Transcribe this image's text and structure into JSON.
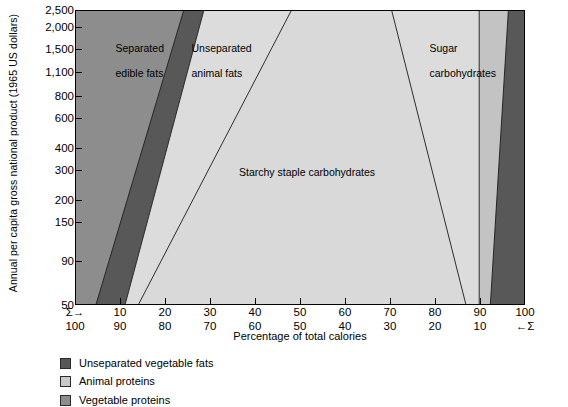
{
  "chart_data": {
    "type": "area",
    "title": "",
    "xlabel": "Percentage of total calories",
    "ylabel": "Annual per capita gross national product (1965 US dollars)",
    "yscale": "log",
    "ylim": [
      50,
      2500
    ],
    "yticks": [
      50,
      90,
      150,
      200,
      300,
      400,
      600,
      800,
      1100,
      1500,
      2000,
      2500
    ],
    "ytick_labels": [
      "50",
      "90",
      "150",
      "200",
      "300",
      "400",
      "600",
      "800",
      "1,100",
      "1,500",
      "2,000",
      "2,500"
    ],
    "xlim": [
      0,
      100
    ],
    "xticks": [
      0,
      10,
      20,
      30,
      40,
      50,
      60,
      70,
      80,
      90,
      100
    ],
    "xtick_labels_top": [
      "Σ→",
      "10",
      "20",
      "30",
      "40",
      "50",
      "60",
      "70",
      "80",
      "90",
      "100"
    ],
    "xtick_labels_bottom": [
      "100",
      "90",
      "80",
      "70",
      "60",
      "50",
      "40",
      "30",
      "20",
      "10",
      "←Σ"
    ],
    "grid": false,
    "legend_position": "below-left",
    "bands": [
      {
        "name": "vegetable-proteins",
        "label": "Vegetable proteins",
        "color": "#8d8d8d",
        "x_at_ymin": 0.0,
        "x_at_ymax": 0.0,
        "x_upper_at_ymin": 4.5,
        "x_upper_at_ymax": 24.0
      },
      {
        "name": "separated-edible-fats",
        "label": "Separated edible fats",
        "color": "#585858",
        "x_lower_at_ymin": 4.5,
        "x_lower_at_ymax": 24.0,
        "x_upper_at_ymin": 11.0,
        "x_upper_at_ymax": 28.5
      },
      {
        "name": "unseparated-animal-fats",
        "label": "Unseparated animal fats",
        "color": "#dcdcdc",
        "x_lower_at_ymin": 11.0,
        "x_lower_at_ymax": 28.5,
        "x_upper_at_ymin": 14.0,
        "x_upper_at_ymax": 48.0
      },
      {
        "name": "starchy-staple-carbohydrates",
        "label": "Starchy staple carbohydrates",
        "color": "#d9d9d9",
        "x_lower_at_ymin": 14.0,
        "x_lower_at_ymax": 48.0,
        "x_upper_at_ymin": 87.0,
        "x_upper_at_ymax": 70.5
      },
      {
        "name": "sugar-carbohydrates",
        "label": "Sugar carbohydrates",
        "color": "#dcdcdc",
        "x_lower_at_ymin": 87.0,
        "x_lower_at_ymax": 70.5,
        "x_upper_at_ymin": 90.0,
        "x_upper_at_ymax": 90.0
      },
      {
        "name": "animal-proteins",
        "label": "Animal proteins",
        "color": "#c3c3c3",
        "x_lower_at_ymin": 90.0,
        "x_lower_at_ymax": 90.0,
        "x_upper_at_ymin": 92.5,
        "x_upper_at_ymax": 96.5
      },
      {
        "name": "unseparated-vegetable-fats",
        "label": "Unseparated vegetable fats",
        "color": "#585858",
        "x_lower_at_ymin": 92.5,
        "x_lower_at_ymax": 96.5,
        "x_upper_at_ymin": 100.0,
        "x_upper_at_ymax": 100.0
      }
    ],
    "annotations": [
      {
        "name": "separated-edible-fats",
        "text": "Separated\nedible fats",
        "x": 12,
        "y": 2050
      },
      {
        "name": "unseparated-animal-fats",
        "text": "Unseparated\nanimal fats",
        "x": 30,
        "y": 2050
      },
      {
        "name": "starchy-staple-carbohydrates",
        "text": "Starchy staple carbohydrates",
        "x": 50,
        "y": 330
      },
      {
        "name": "sugar-carbohydrates",
        "text": "Sugar\ncarbohydrates",
        "x": 79,
        "y": 2050
      }
    ]
  },
  "axis": {
    "y_title": "Annual per capita gross national product (1965 US dollars)",
    "x_title": "Percentage of total calories",
    "y_labels": [
      "2,500",
      "2,000",
      "1,500",
      "1,100",
      "800",
      "600",
      "400",
      "300",
      "200",
      "150",
      "90",
      "50"
    ],
    "x_labels": [
      {
        "top": "Σ→",
        "bottom": "100"
      },
      {
        "top": "10",
        "bottom": "90"
      },
      {
        "top": "20",
        "bottom": "80"
      },
      {
        "top": "30",
        "bottom": "70"
      },
      {
        "top": "40",
        "bottom": "60"
      },
      {
        "top": "50",
        "bottom": "50"
      },
      {
        "top": "60",
        "bottom": "40"
      },
      {
        "top": "70",
        "bottom": "30"
      },
      {
        "top": "80",
        "bottom": "20"
      },
      {
        "top": "90",
        "bottom": "10"
      },
      {
        "top": "100",
        "bottom": "←Σ"
      }
    ]
  },
  "plot_labels": {
    "separated_edible_fats_l1": "Separated",
    "separated_edible_fats_l2": "edible fats",
    "unseparated_animal_fats_l1": "Unseparated",
    "unseparated_animal_fats_l2": "animal fats",
    "sugar_carbohydrates_l1": "Sugar",
    "sugar_carbohydrates_l2": "carbohydrates",
    "starchy_staple": "Starchy staple carbohydrates"
  },
  "legend": {
    "items": [
      {
        "label": "Unseparated vegetable fats",
        "color": "#585858"
      },
      {
        "label": "Animal proteins",
        "color": "#c9c9c9"
      },
      {
        "label": "Vegetable proteins",
        "color": "#8d8d8d"
      }
    ]
  },
  "colors": {
    "vegetable_proteins": "#8d8d8d",
    "separated_edible_fats": "#585858",
    "unseparated_animal_fats": "#dcdcdc",
    "starchy_staple": "#d9d9d9",
    "sugar_carbohydrates": "#dcdcdc",
    "animal_proteins": "#c3c3c3",
    "unseparated_vegetable_fats": "#585858",
    "outline": "#000000",
    "background": "#ffffff"
  }
}
